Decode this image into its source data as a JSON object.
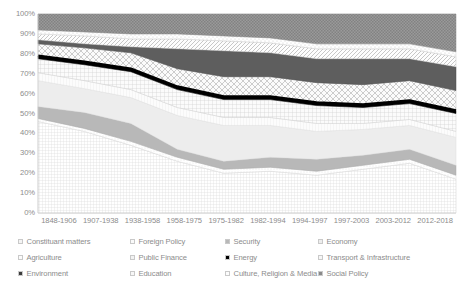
{
  "chart_data": {
    "type": "area",
    "stacked": "percent",
    "title": "",
    "subtitle": "",
    "xlabel": "",
    "ylabel": "",
    "ylim": [
      0,
      100
    ],
    "ytick_labels": [
      "100%",
      "90%",
      "80%",
      "70%",
      "60%",
      "50%",
      "40%",
      "30%",
      "20%",
      "10%",
      "0%"
    ],
    "ytick_values": [
      100,
      90,
      80,
      70,
      60,
      50,
      40,
      30,
      20,
      10,
      0
    ],
    "grid": true,
    "legend_position": "bottom",
    "categories": [
      "1848-1906",
      "1907-1938",
      "1938-1958",
      "1958-1975",
      "1975-1982",
      "1982-1994",
      "1994-1997",
      "1997-2003",
      "2003-2012",
      "2012-2018"
    ],
    "series": [
      {
        "name": "Constituant matters",
        "pattern": "fine-grid",
        "color": "#f2f2f2",
        "values": [
          46,
          41,
          34,
          26,
          20,
          21,
          19,
          22,
          25,
          17
        ]
      },
      {
        "name": "Foreign Policy",
        "pattern": "light-dots",
        "color": "#fafafa",
        "values": [
          1.5,
          1.5,
          2,
          2,
          2,
          2,
          2,
          2,
          2,
          2
        ]
      },
      {
        "name": "Security",
        "pattern": "solid-mid-grey",
        "color": "#b3b3b3",
        "values": [
          6,
          8,
          9,
          4,
          4,
          5,
          6,
          5,
          5,
          5
        ]
      },
      {
        "name": "Economy",
        "pattern": "light-solid",
        "color": "#ededed",
        "values": [
          13,
          12,
          13,
          17,
          18,
          16,
          14,
          13,
          12,
          14
        ]
      },
      {
        "name": "Agriculture",
        "pattern": "faint-vertical",
        "color": "#fbfbfb",
        "values": [
          4,
          4,
          4,
          4,
          4,
          4,
          4,
          3,
          3,
          3
        ]
      },
      {
        "name": "Public Finance",
        "pattern": "med-grid",
        "color": "#f0f0f0",
        "values": [
          7,
          8,
          9,
          9,
          9,
          9,
          9,
          8,
          8,
          9
        ]
      },
      {
        "name": "Energy",
        "pattern": "solid-black",
        "color": "#000000",
        "values": [
          1.5,
          1.5,
          1.5,
          1.5,
          1.5,
          1.5,
          1.5,
          1.5,
          1.5,
          1.5
        ]
      },
      {
        "name": "Transport & Infrastructure",
        "pattern": "diagonal-cross",
        "color": "#f5f5f5",
        "values": [
          6,
          7,
          8,
          9,
          10,
          10,
          10,
          10,
          10,
          10
        ]
      },
      {
        "name": "Environment",
        "pattern": "solid-dark-grey",
        "color": "#5a5a5a",
        "values": [
          2,
          2,
          3,
          10,
          13,
          12,
          12,
          13,
          11,
          12
        ]
      },
      {
        "name": "Education",
        "pattern": "narrow-diagonal",
        "color": "#f7f7f7",
        "values": [
          3,
          4,
          4,
          5,
          5,
          5,
          5,
          5,
          5,
          5
        ]
      },
      {
        "name": "Culture, Religion & Media",
        "pattern": "sparse-dots",
        "color": "#fcfcfc",
        "values": [
          2,
          2,
          2.5,
          2.5,
          2.5,
          2.5,
          2.5,
          2.5,
          2.5,
          2.5
        ]
      },
      {
        "name": "Social Policy",
        "pattern": "dark-checker",
        "color": "#909090",
        "values": [
          8,
          9,
          10,
          10,
          11,
          12,
          15,
          15,
          15,
          19
        ]
      }
    ],
    "cumulative_boundaries": {
      "note": "Upper edge of each band, in percent, per period, bottom-to-top stacking order",
      "Constituant matters": [
        46,
        41,
        34,
        26,
        20,
        21,
        19,
        22,
        25,
        17
      ],
      "Foreign Policy": [
        47.5,
        42.5,
        36,
        28,
        22,
        23,
        21,
        24,
        27,
        19
      ],
      "Security": [
        53.5,
        50.5,
        45,
        32,
        26,
        28,
        27,
        29,
        32,
        24
      ],
      "Economy": [
        66.5,
        62.5,
        58,
        49,
        44,
        44,
        41,
        42,
        44,
        38
      ],
      "Agriculture": [
        70.5,
        66.5,
        62,
        53,
        48,
        48,
        45,
        45,
        47,
        41
      ],
      "Public Finance": [
        77.5,
        74.5,
        71,
        62,
        57,
        57,
        54,
        53,
        55,
        50
      ],
      "Energy": [
        79,
        76,
        72.5,
        63.5,
        58.5,
        58.5,
        55.5,
        54.5,
        56.5,
        51.5
      ],
      "Transport & Infrastructure": [
        85,
        83,
        80.5,
        72.5,
        68.5,
        68.5,
        65.5,
        64.5,
        66.5,
        61.5
      ],
      "Environment": [
        87,
        85,
        83.5,
        82.5,
        81.5,
        80.5,
        77.5,
        77.5,
        77.5,
        73.5
      ],
      "Education": [
        90,
        89,
        87.5,
        87.5,
        86.5,
        85.5,
        82.5,
        82.5,
        82.5,
        78.5
      ],
      "Culture, Religion & Media": [
        92,
        91,
        90,
        90,
        89,
        88,
        85,
        85,
        85,
        81
      ],
      "Social Policy": [
        100,
        100,
        100,
        100,
        100,
        100,
        100,
        100,
        100,
        100
      ]
    }
  },
  "legend": {
    "items": [
      {
        "label": "Constituant matters"
      },
      {
        "label": "Foreign Policy"
      },
      {
        "label": "Security"
      },
      {
        "label": "Economy"
      },
      {
        "label": "Agriculture"
      },
      {
        "label": "Public Finance"
      },
      {
        "label": "Energy"
      },
      {
        "label": "Transport & Infrastructure"
      },
      {
        "label": "Environment"
      },
      {
        "label": "Education"
      },
      {
        "label": "Culture, Religion & Media"
      },
      {
        "label": "Social Policy"
      }
    ]
  }
}
